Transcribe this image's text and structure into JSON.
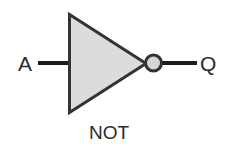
{
  "diagram": {
    "gate_label": "NOT",
    "background_color": "#ffffff",
    "body": {
      "shape_name": "triangle",
      "fill_color": "#dcdcdc",
      "stroke_color": "#333333",
      "stroke_width": 3
    },
    "bubble": {
      "shape_name": "inversion-bubble",
      "fill_color": "#d6d6d6",
      "stroke_color": "#333333",
      "stroke_width": 3,
      "diameter": 17
    },
    "wires": {
      "stroke_color": "#1c1c1c",
      "stroke_width": 4
    },
    "ports": [
      {
        "id": "input",
        "label": "A",
        "side": "left"
      },
      {
        "id": "output",
        "label": "Q",
        "side": "right"
      }
    ]
  }
}
